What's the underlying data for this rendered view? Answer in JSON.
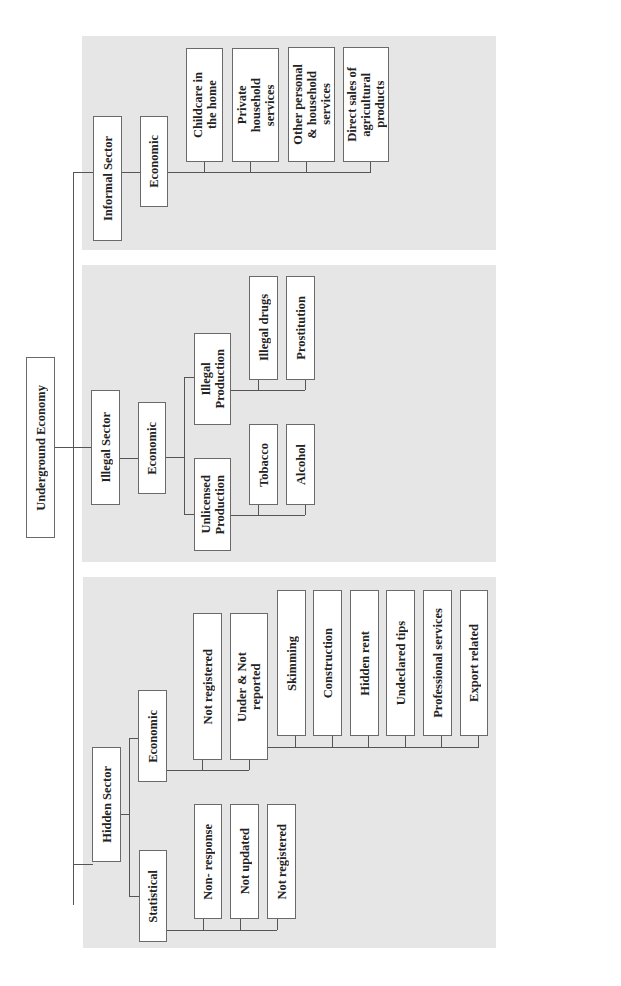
{
  "diagram": {
    "root": "Underground Economy",
    "sectors": {
      "informal": {
        "label": "Informal Sector",
        "economic": "Economic",
        "items": [
          "Childcare in\nthe home",
          "Private\nhousehold\nservices",
          "Other personal\n& household\nservices",
          "Direct sales of\nagricultural\nproducts"
        ]
      },
      "illegal": {
        "label": "Illegal Sector",
        "economic": "Economic",
        "illegal_production": {
          "label": "Illegal\nProduction",
          "items": [
            "Illegal drugs",
            "Prostitution"
          ]
        },
        "unlicensed_production": {
          "label": "Unlicensed\nProduction",
          "items": [
            "Tobacco",
            "Alcohol"
          ]
        }
      },
      "hidden": {
        "label": "Hidden Sector",
        "economic": {
          "label": "Economic",
          "not_registered": "Not registered",
          "under_not_reported": {
            "label": "Under & Not\nreported",
            "items": [
              "Skimming",
              "Construction",
              "Hidden rent",
              "Undeclared tips",
              "Professional services",
              "Export related"
            ]
          }
        },
        "statistical": {
          "label": "Statistical",
          "items": [
            "Non- response",
            "Not updated",
            "Not registered"
          ]
        }
      }
    }
  }
}
